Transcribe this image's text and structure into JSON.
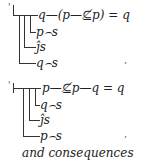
{
  "formulas": [
    {
      "main": "q—(p—⊈p) = q",
      "conditions": [
        "p⌢s",
        "ĵs",
        "q⌢s"
      ],
      "end_mark": ","
    },
    {
      "main": "p—⊈p—q = q",
      "conditions": [
        "q⌢s",
        "ĵs",
        "p⌢s"
      ],
      "end_mark": ","
    }
  ],
  "caption": "and consequences"
}
